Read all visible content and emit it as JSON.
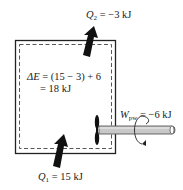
{
  "diagram": {
    "type": "thermodynamic-system-energy-balance",
    "heat_out": {
      "symbol": "Q",
      "subscript": "2",
      "value": "= −3 kJ"
    },
    "heat_in": {
      "symbol": "Q",
      "subscript": "1",
      "value": "= 15 kJ"
    },
    "work": {
      "symbol": "W",
      "subscript": "pw",
      "value": "= −6 kJ"
    },
    "energy_change": {
      "line1_symbol": "ΔE",
      "line1_rest": " = (15 − 3) + 6",
      "line2": "= 18 kJ"
    },
    "colors": {
      "stroke": "#222222",
      "arrow": "#111111",
      "shaft": "#c8c8c8"
    }
  }
}
